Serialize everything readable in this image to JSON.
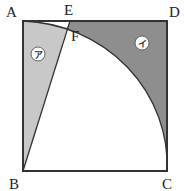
{
  "figure": {
    "type": "geometry",
    "points": {
      "A": {
        "label": "A",
        "x": 23,
        "y": 21
      },
      "D": {
        "label": "D",
        "x": 167,
        "y": 21
      },
      "B": {
        "label": "B",
        "x": 23,
        "y": 171
      },
      "C": {
        "label": "C",
        "x": 167,
        "y": 171
      },
      "E": {
        "label": "E",
        "x": 70,
        "y": 21
      },
      "F": {
        "label": "F",
        "x": 67,
        "y": 28
      }
    },
    "regions": [
      {
        "id": "a",
        "label": "ア",
        "color": "#c8c8c8"
      },
      {
        "id": "i",
        "label": "イ",
        "color": "#8e8e8e"
      }
    ],
    "stroke_color": "#333333"
  }
}
